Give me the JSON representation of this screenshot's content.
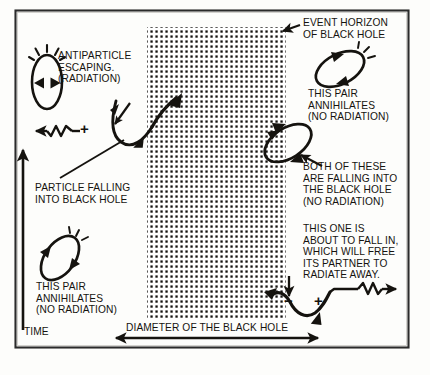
{
  "figure": {
    "frame": {
      "x": 15,
      "y": 10,
      "width": 394,
      "height": 338,
      "border_color": "#2b2b2b"
    },
    "background_color": "#fdfdfb",
    "ink_color": "#15130f"
  },
  "black_hole": {
    "label_event_horizon": "EVENT HORIZON\nOF BLACK HOLE",
    "region_fill": "stipple-dots",
    "region": {
      "x": 147,
      "y": 27,
      "width": 139,
      "height": 293
    }
  },
  "axes": {
    "time": {
      "label": "TIME",
      "direction": "up",
      "x": 23,
      "y_top": 145,
      "y_bottom": 330
    },
    "diameter": {
      "label": "DIAMETER OF THE BLACK HOLE",
      "direction": "double",
      "y": 338,
      "x_start": 112,
      "x_end": 322
    }
  },
  "annotations": [
    {
      "id": "antiparticle-escaping",
      "text": "ANTIPARTICLE\nESCAPING.\n(RADIATION)",
      "x": 58,
      "y": 50
    },
    {
      "id": "particle-falling",
      "text": "PARTICLE FALLING\nINTO BLACK HOLE",
      "x": 35,
      "y": 182
    },
    {
      "id": "pair-annihilates-left",
      "text": "THIS PAIR\nANNIHILATES\n(NO RADIATION)",
      "x": 36,
      "y": 281
    },
    {
      "id": "event-horizon",
      "text": "EVENT HORIZON\nOF BLACK HOLE",
      "x": 303,
      "y": 17
    },
    {
      "id": "pair-annihilates-right",
      "text": "THIS PAIR\nANNIHILATES\n(NO RADIATION)",
      "x": 308,
      "y": 88
    },
    {
      "id": "both-falling",
      "text": "BOTH OF THESE\nARE FALLING INTO\nTHE BLACK HOLE\n(NO RADIATION)",
      "x": 303,
      "y": 161
    },
    {
      "id": "about-to-fall-in",
      "text": "THIS ONE IS\nABOUT TO FALL IN,\nWHICH WILL FREE\nITS PARTNER TO\nRADIATE AWAY.",
      "x": 303,
      "y": 223
    }
  ],
  "charges": [
    {
      "id": "charge-plus-upper-left",
      "symbol": "+",
      "x": 84,
      "y": 131
    },
    {
      "id": "charge-minus-lower-right",
      "symbol": "−",
      "x": 289,
      "y": 303
    },
    {
      "id": "charge-plus-lower-right",
      "symbol": "+",
      "x": 320,
      "y": 303
    }
  ],
  "pairs": [
    {
      "id": "virtual-pair-upper-left",
      "kind": "vertical-ellipse",
      "annihilates": true,
      "burst": true
    },
    {
      "id": "virtual-pair-lower-left",
      "kind": "tilted-ellipse",
      "annihilates": true,
      "burst": true
    },
    {
      "id": "virtual-pair-upper-right",
      "kind": "tilted-ellipse",
      "annihilates": true,
      "burst": true
    },
    {
      "id": "virtual-pair-straddling",
      "kind": "tilted-ellipse",
      "annihilates": false,
      "burst": false
    },
    {
      "id": "split-pair-upper-horizon",
      "kind": "u-curve",
      "annihilates": false,
      "burst": false
    },
    {
      "id": "split-pair-lower-horizon",
      "kind": "u-curve",
      "annihilates": false,
      "burst": false
    }
  ],
  "radiation": [
    {
      "id": "radiation-wave-left",
      "direction": "left",
      "glyph": "zigzag-arrow"
    },
    {
      "id": "radiation-wave-right",
      "direction": "right",
      "glyph": "zigzag-arrow"
    }
  ]
}
